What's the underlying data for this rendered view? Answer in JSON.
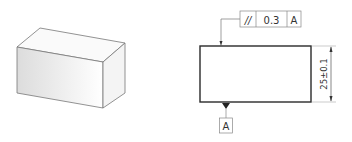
{
  "isometric_view": {
    "shape": "rectangular-block"
  },
  "orthographic_view": {
    "feature_control_frame": {
      "symbol": "//",
      "symbol_name": "parallelism",
      "tolerance": "0.3",
      "datum_ref": "A"
    },
    "dimension": {
      "label": "25±0.1"
    },
    "datum_feature": {
      "label": "A"
    }
  },
  "colors": {
    "line": "#2a2a2a",
    "thin_line": "#888888",
    "face_shade": "#e6e6e6"
  }
}
